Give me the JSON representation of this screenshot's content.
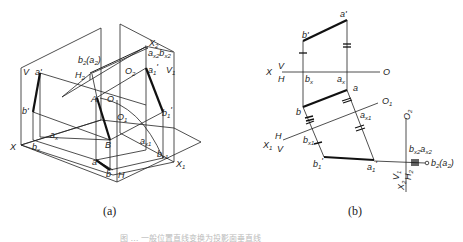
{
  "figure": {
    "panel_a": {
      "caption": "(a)",
      "labels": {
        "V": "V",
        "a_prime": "a'",
        "b_prime": "b'",
        "X": "X",
        "b_x": "b",
        "b_x_sub": "x",
        "a_x": "a",
        "a_x_sub": "x",
        "H2": "H",
        "H2_sub": "2",
        "b2a2": "b",
        "b2a2_sub": "2",
        "b2a2_paren": "(a",
        "b2a2_paren_sub": "2",
        "b2a2_close": ")",
        "X2": "X",
        "X2_sub": "2",
        "ax2bx2": "a",
        "ax2_sub": "x2",
        "bx2": "b",
        "bx2_sub": "x2",
        "O2": "O",
        "O2_sub": "2",
        "a1_prime": "a",
        "a1_prime_sub": "1",
        "V1": "V",
        "V1_sub": "1",
        "A": "A",
        "O": "O",
        "O1": "O",
        "O1_sub": "1",
        "b1_prime": "b",
        "b1_prime_sub": "1",
        "B": "B",
        "a_x1": "a",
        "a_x1_sub": "x1",
        "b_x1": "b",
        "b_x1_sub": "x1",
        "a": "a",
        "b": "b",
        "H": "H",
        "X1": "X",
        "X1_sub": "1"
      }
    },
    "panel_b": {
      "caption": "(b)",
      "labels": {
        "a_prime": "a'",
        "b_prime": "b'",
        "X": "X",
        "V": "V",
        "H": "H",
        "O": "O",
        "b_x": "b",
        "b_x_sub": "x",
        "a_x": "a",
        "a_x_sub": "x",
        "a": "a",
        "b": "b",
        "O1": "O",
        "O1_sub": "1",
        "a_x1": "a",
        "a_x1_sub": "x1",
        "X1": "X",
        "X1_sub": "1",
        "H_1": "H",
        "V_1": "V",
        "b_x1": "b",
        "b_x1_sub": "x1",
        "b1_prime": "b",
        "b1_prime_sub": "1",
        "a1_prime": "a",
        "a1_prime_sub": "1",
        "O2": "O",
        "O2_sub": "2",
        "bx2ax2": "b",
        "bx2_sub": "x2",
        "ax2": "a",
        "ax2_sub": "x2",
        "b2a2": "b",
        "b2a2_sub": "2",
        "b2a2_paren": "(a",
        "b2a2_paren_sub": "2",
        "b2a2_close": ")",
        "V1": "V",
        "V1_sub": "1",
        "H2": "H",
        "H2_sub": "2",
        "X2": "X",
        "X2_sub": "2"
      }
    },
    "caption": "图 … 一般位置直线变换为投影面垂直线"
  }
}
